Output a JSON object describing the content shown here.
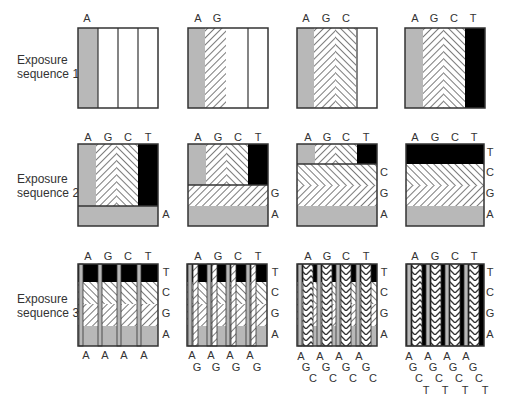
{
  "colors": {
    "A": "#b8b8b8",
    "T": "#000000",
    "outline": "#333333",
    "hatch": "#333333",
    "bg": "#ffffff"
  },
  "rows": [
    {
      "label_line1": "Exposure",
      "label_line2": "sequence 1"
    },
    {
      "label_line1": "Exposure",
      "label_line2": "sequence 2"
    },
    {
      "label_line1": "Exposure",
      "label_line2": "sequence 3"
    }
  ],
  "row1": {
    "panels": [
      {
        "top_labels": [
          "A"
        ]
      },
      {
        "top_labels": [
          "A",
          "G"
        ]
      },
      {
        "top_labels": [
          "A",
          "G",
          "C"
        ]
      },
      {
        "top_labels": [
          "A",
          "G",
          "C",
          "T"
        ]
      }
    ]
  },
  "row2": {
    "panels": [
      {
        "top_labels": [
          "A",
          "G",
          "C",
          "T"
        ],
        "side_labels": [
          "A"
        ]
      },
      {
        "top_labels": [
          "A",
          "G",
          "C",
          "T"
        ],
        "side_labels": [
          "G",
          "A"
        ]
      },
      {
        "top_labels": [
          "A",
          "G",
          "C",
          "T"
        ],
        "side_labels": [
          "C",
          "G",
          "A"
        ]
      },
      {
        "top_labels": [
          "A",
          "G",
          "C",
          "T"
        ],
        "side_labels": [
          "T",
          "C",
          "G",
          "A"
        ]
      }
    ]
  },
  "row3": {
    "panels": [
      {
        "top_labels": [
          "A",
          "G",
          "C",
          "T"
        ],
        "side_labels": [
          "T",
          "C",
          "G",
          "A"
        ],
        "bottom_rows": [
          [
            "A",
            "A",
            "A",
            "A"
          ]
        ]
      },
      {
        "top_labels": [
          "A",
          "G",
          "C",
          "T"
        ],
        "side_labels": [
          "T",
          "C",
          "G",
          "A"
        ],
        "bottom_rows": [
          [
            "A",
            "A",
            "A",
            "A"
          ],
          [
            "G",
            "G",
            "G",
            "G"
          ]
        ]
      },
      {
        "top_labels": [
          "A",
          "G",
          "C",
          "T"
        ],
        "side_labels": [
          "T",
          "C",
          "G",
          "A"
        ],
        "bottom_rows": [
          [
            "A",
            "A",
            "A",
            "A"
          ],
          [
            "G",
            "G",
            "G",
            "G"
          ],
          [
            "C",
            "C",
            "C",
            "C"
          ]
        ]
      },
      {
        "top_labels": [
          "A",
          "G",
          "C",
          "T"
        ],
        "side_labels": [
          "T",
          "C",
          "G",
          "A"
        ],
        "bottom_rows": [
          [
            "A",
            "A",
            "A",
            "A"
          ],
          [
            "G",
            "G",
            "G",
            "G"
          ],
          [
            "C",
            "C",
            "C",
            "C"
          ],
          [
            "T",
            "T",
            "T",
            "T"
          ]
        ]
      }
    ]
  }
}
